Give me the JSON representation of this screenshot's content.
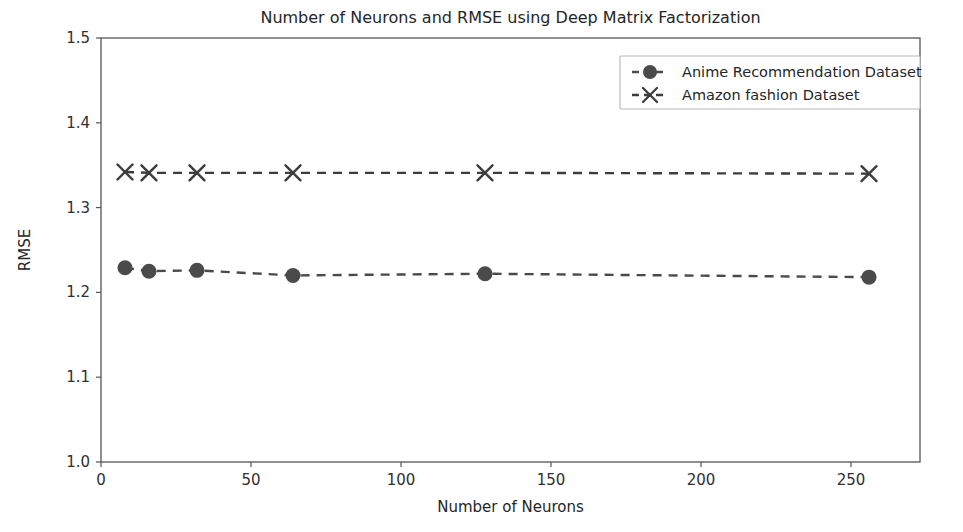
{
  "chart_data": {
    "type": "line",
    "title": "Number of Neurons and RMSE using Deep Matrix Factorization",
    "xlabel": "Number of Neurons",
    "ylabel": "RMSE",
    "xlim": [
      0,
      273
    ],
    "ylim": [
      1.0,
      1.5
    ],
    "grid": false,
    "legend_position": "upper right",
    "x": [
      8,
      16,
      32,
      64,
      128,
      256
    ],
    "xticks": [
      0,
      50,
      100,
      150,
      200,
      250
    ],
    "xticklabels": [
      "0",
      "50",
      "100",
      "150",
      "200",
      "250"
    ],
    "yticks": [
      1.0,
      1.1,
      1.2,
      1.3,
      1.4,
      1.5
    ],
    "yticklabels": [
      "1.0",
      "1.1",
      "1.2",
      "1.3",
      "1.4",
      "1.5"
    ],
    "series": [
      {
        "name": "Anime Recommendation Dataset",
        "marker": "circle",
        "linestyle": "dashed",
        "color": "#4a4a4a",
        "values": [
          1.229,
          1.225,
          1.226,
          1.22,
          1.222,
          1.218
        ]
      },
      {
        "name": "Amazon fashion Dataset",
        "marker": "x",
        "linestyle": "dashed",
        "color": "#3d3d3d",
        "values": [
          1.342,
          1.341,
          1.341,
          1.341,
          1.341,
          1.34
        ]
      }
    ]
  },
  "figure": {
    "background": "#ffffff",
    "axis_color": "#555555",
    "text_color": "#262626"
  }
}
